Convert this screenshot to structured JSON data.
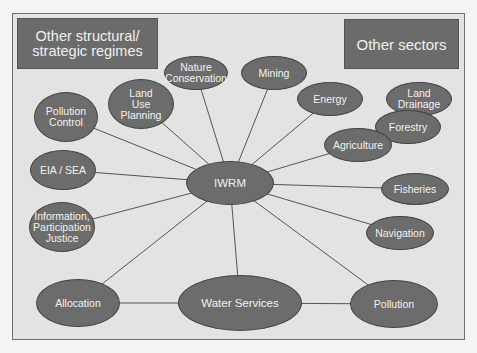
{
  "colors": {
    "page_background": "#f4f4f4",
    "frame_background": "#e3e3e3",
    "frame_border": "#6e6e6e",
    "node_fill": "#6c6c6c",
    "node_text": "#f2f2f2",
    "edge": "#555555"
  },
  "corner_boxes": {
    "left": {
      "label": "Other structural/\nstrategic regimes"
    },
    "right": {
      "label": "Other sectors"
    }
  },
  "center_node": {
    "id": "iwrm",
    "label": "IWRM"
  },
  "nodes": [
    {
      "id": "iwrm",
      "label": "IWRM",
      "cx": 230,
      "cy": 183,
      "rx": 44,
      "ry": 22
    },
    {
      "id": "water-services",
      "label": "Water Services",
      "cx": 240,
      "cy": 303,
      "rx": 62,
      "ry": 28
    },
    {
      "id": "allocation",
      "label": "Allocation",
      "cx": 78,
      "cy": 303,
      "rx": 42,
      "ry": 24
    },
    {
      "id": "pollution",
      "label": "Pollution",
      "cx": 394,
      "cy": 304,
      "rx": 44,
      "ry": 24
    },
    {
      "id": "information-participation-justice",
      "label": "Information,\nParticipation\nJustice",
      "cx": 62,
      "cy": 227,
      "rx": 33,
      "ry": 25
    },
    {
      "id": "eia-sea",
      "label": "EIA / SEA",
      "cx": 63,
      "cy": 170,
      "rx": 33,
      "ry": 20
    },
    {
      "id": "pollution-control",
      "label": "Pollution\nControl",
      "cx": 66,
      "cy": 117,
      "rx": 32,
      "ry": 25
    },
    {
      "id": "land-use-planning",
      "label": "Land\nUse\nPlanning",
      "cx": 141,
      "cy": 104,
      "rx": 33,
      "ry": 25
    },
    {
      "id": "nature-conservation",
      "label": "Nature\nConservation",
      "cx": 196,
      "cy": 73,
      "rx": 32,
      "ry": 17
    },
    {
      "id": "mining",
      "label": "Mining",
      "cx": 274,
      "cy": 73,
      "rx": 33,
      "ry": 17
    },
    {
      "id": "energy",
      "label": "Energy",
      "cx": 330,
      "cy": 99,
      "rx": 33,
      "ry": 17
    },
    {
      "id": "land-drainage",
      "label": "Land\nDrainage",
      "cx": 419,
      "cy": 99,
      "rx": 33,
      "ry": 17
    },
    {
      "id": "forestry",
      "label": "Forestry",
      "cx": 408,
      "cy": 127,
      "rx": 33,
      "ry": 17
    },
    {
      "id": "agriculture",
      "label": "Agriculture",
      "cx": 358,
      "cy": 145,
      "rx": 34,
      "ry": 17
    },
    {
      "id": "fisheries",
      "label": "Fisheries",
      "cx": 415,
      "cy": 189,
      "rx": 34,
      "ry": 16
    },
    {
      "id": "navigation",
      "label": "Navigation",
      "cx": 400,
      "cy": 233,
      "rx": 34,
      "ry": 17
    }
  ],
  "edges": [
    [
      "iwrm",
      "pollution-control"
    ],
    [
      "iwrm",
      "land-use-planning"
    ],
    [
      "iwrm",
      "nature-conservation"
    ],
    [
      "iwrm",
      "mining"
    ],
    [
      "iwrm",
      "energy"
    ],
    [
      "iwrm",
      "agriculture"
    ],
    [
      "iwrm",
      "fisheries"
    ],
    [
      "iwrm",
      "navigation"
    ],
    [
      "iwrm",
      "pollution"
    ],
    [
      "iwrm",
      "water-services"
    ],
    [
      "iwrm",
      "allocation"
    ],
    [
      "iwrm",
      "information-participation-justice"
    ],
    [
      "iwrm",
      "eia-sea"
    ],
    [
      "allocation",
      "water-services"
    ],
    [
      "water-services",
      "pollution"
    ]
  ]
}
